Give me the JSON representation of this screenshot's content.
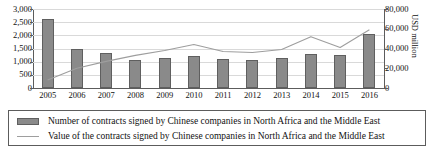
{
  "chart_data": {
    "type": "bar",
    "title": "",
    "xlabel": "",
    "ylabel": "",
    "y2label": "USD million",
    "grid": true,
    "legend_position": "bottom",
    "categories": [
      "2005",
      "2006",
      "2007",
      "2008",
      "2009",
      "2010",
      "2011",
      "2012",
      "2013",
      "2014",
      "2015",
      "2016"
    ],
    "ylim": [
      0,
      3000
    ],
    "y2lim": [
      0,
      80000
    ],
    "yticks": [
      "0",
      "500",
      "1,000",
      "1,500",
      "2,000",
      "2,500",
      "3,000"
    ],
    "y2ticks": [
      "0",
      "20,000",
      "40,000",
      "60,000",
      "80,000"
    ],
    "series": [
      {
        "name": "Number of contracts signed by Chinese companies in North Africa and the Middle East",
        "type": "bar",
        "axis": "left",
        "color": "#8a8a8a",
        "values": [
          2620,
          1500,
          1330,
          1080,
          1140,
          1200,
          1100,
          1080,
          1150,
          1280,
          1250,
          2050
        ]
      },
      {
        "name": "Value of the contracts signed by Chinese companies in North Africa and the Middle East",
        "type": "line",
        "axis": "right",
        "color": "#9e9e9e",
        "values": [
          8000,
          20000,
          27000,
          33000,
          38000,
          44000,
          37000,
          36000,
          39000,
          52000,
          41000,
          59000
        ]
      }
    ]
  },
  "legend": {
    "items": [
      {
        "marker": "bar-swatch",
        "label": "Number of contracts signed by Chinese companies in North Africa and the Middle East"
      },
      {
        "marker": "line-swatch",
        "label": "Value of the contracts signed by Chinese companies in North Africa and the Middle East"
      }
    ]
  }
}
